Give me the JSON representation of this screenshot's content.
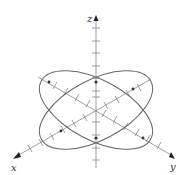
{
  "diagram": {
    "type": "3d-coordinate-axes-with-ellipses",
    "colors": {
      "background": "#ffffff",
      "axis": "#777777",
      "curve": "#666666",
      "label": "#333333"
    },
    "origin": [
      96,
      110
    ],
    "axes": [
      {
        "name": "x",
        "label": "x",
        "end": [
          14,
          158
        ],
        "label_pos": [
          13,
          171
        ]
      },
      {
        "name": "y",
        "label": "y",
        "end": [
          174,
          158
        ],
        "label_pos": [
          172,
          170
        ]
      },
      {
        "name": "z",
        "label": "z",
        "end": [
          96,
          16
        ],
        "label_pos": [
          88,
          21
        ]
      }
    ],
    "ellipses": [
      {
        "name": "ellipse-a",
        "cx": 96,
        "cy": 110,
        "rx": 62,
        "ry": 30,
        "rotate": 28
      },
      {
        "name": "ellipse-b",
        "cx": 96,
        "cy": 110,
        "rx": 62,
        "ry": 30,
        "rotate": -28
      }
    ],
    "intersection_points": [
      [
        96,
        82
      ],
      [
        96,
        138
      ],
      [
        49,
        82
      ],
      [
        143,
        138
      ],
      [
        61,
        131
      ],
      [
        133,
        89
      ]
    ]
  }
}
